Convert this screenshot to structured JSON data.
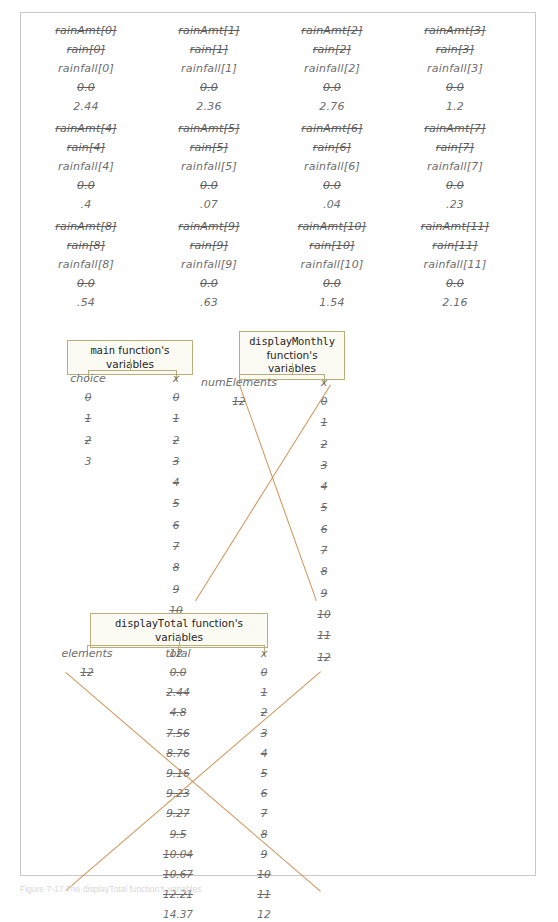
{
  "page": {
    "caption": "Figure 7-17   The displayTotal function's variables",
    "accent_box_border": "#b9ae7a",
    "accent_strike_orange": "#c98a4b",
    "text_color": "#6d6d6d"
  },
  "arrays": {
    "cells": [
      {
        "old_name_1": "rainAmt[0]",
        "old_name_2": "rain[0]",
        "name": "rainfall[0]",
        "old_value": "0.0",
        "value": "2.44"
      },
      {
        "old_name_1": "rainAmt[1]",
        "old_name_2": "rain[1]",
        "name": "rainfall[1]",
        "old_value": "0.0",
        "value": "2.36"
      },
      {
        "old_name_1": "rainAmt[2]",
        "old_name_2": "rain[2]",
        "name": "rainfall[2]",
        "old_value": "0.0",
        "value": "2.76"
      },
      {
        "old_name_1": "rainAmt[3]",
        "old_name_2": "rain[3]",
        "name": "rainfall[3]",
        "old_value": "0.0",
        "value": "1.2"
      },
      {
        "old_name_1": "rainAmt[4]",
        "old_name_2": "rain[4]",
        "name": "rainfall[4]",
        "old_value": "0.0",
        "value": ".4"
      },
      {
        "old_name_1": "rainAmt[5]",
        "old_name_2": "rain[5]",
        "name": "rainfall[5]",
        "old_value": "0.0",
        "value": ".07"
      },
      {
        "old_name_1": "rainAmt[6]",
        "old_name_2": "rain[6]",
        "name": "rainfall[6]",
        "old_value": "0.0",
        "value": ".04"
      },
      {
        "old_name_1": "rainAmt[7]",
        "old_name_2": "rain[7]",
        "name": "rainfall[7]",
        "old_value": "0.0",
        "value": ".23"
      },
      {
        "old_name_1": "rainAmt[8]",
        "old_name_2": "rain[8]",
        "name": "rainfall[8]",
        "old_value": "0.0",
        "value": ".54"
      },
      {
        "old_name_1": "rainAmt[9]",
        "old_name_2": "rain[9]",
        "name": "rainfall[9]",
        "old_value": "0.0",
        "value": ".63"
      },
      {
        "old_name_1": "rainAmt[10]",
        "old_name_2": "rain[10]",
        "name": "rainfall[10]",
        "old_value": "0.0",
        "value": "1.54"
      },
      {
        "old_name_1": "rainAmt[11]",
        "old_name_2": "rain[11]",
        "name": "rainfall[11]",
        "old_value": "0.0",
        "value": "2.16"
      }
    ]
  },
  "main_frame": {
    "title_mono": "main",
    "title_rest": " function's variables",
    "columns": [
      {
        "name": "choice",
        "values": [
          "0",
          "1",
          "2",
          "3"
        ],
        "final_index": 3
      },
      {
        "name": "x",
        "values": [
          "0",
          "1",
          "2",
          "3",
          "4",
          "5",
          "6",
          "7",
          "8",
          "9",
          "10",
          "11",
          "12"
        ],
        "final_index": 12
      }
    ]
  },
  "display_monthly_frame": {
    "title_mono": "displayMonthly",
    "title_rest": "function's variables",
    "columns": [
      {
        "name": "numElements",
        "values": [
          "12"
        ],
        "final_index": -1
      },
      {
        "name": "x",
        "values": [
          "0",
          "1",
          "2",
          "3",
          "4",
          "5",
          "6",
          "7",
          "8",
          "9",
          "10",
          "11",
          "12"
        ],
        "final_index": -1
      }
    ]
  },
  "display_total_frame": {
    "title_mono": "displayTotal",
    "title_rest": " function's variables",
    "columns": [
      {
        "name": "elements",
        "values": [
          "12"
        ],
        "final_index": -1
      },
      {
        "name": "total",
        "values": [
          "0.0",
          "2.44",
          "4.8",
          "7.56",
          "8.76",
          "9.16",
          "9.23",
          "9.27",
          "9.5",
          "10.04",
          "10.67",
          "12.21",
          "14.37"
        ],
        "final_index": 12
      },
      {
        "name": "x",
        "values": [
          "0",
          "1",
          "2",
          "3",
          "4",
          "5",
          "6",
          "7",
          "8",
          "9",
          "10",
          "11",
          "12"
        ],
        "final_index": 12
      }
    ]
  }
}
